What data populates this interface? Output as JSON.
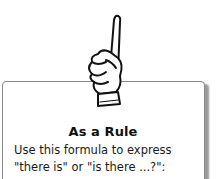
{
  "rule_box": {
    "title": "As a Rule",
    "lines": [
      "Use this formula to express",
      "\"there is\" or \"is there ...?\":"
    ]
  },
  "illustration": {
    "icon": "pointing-hand-icon"
  }
}
